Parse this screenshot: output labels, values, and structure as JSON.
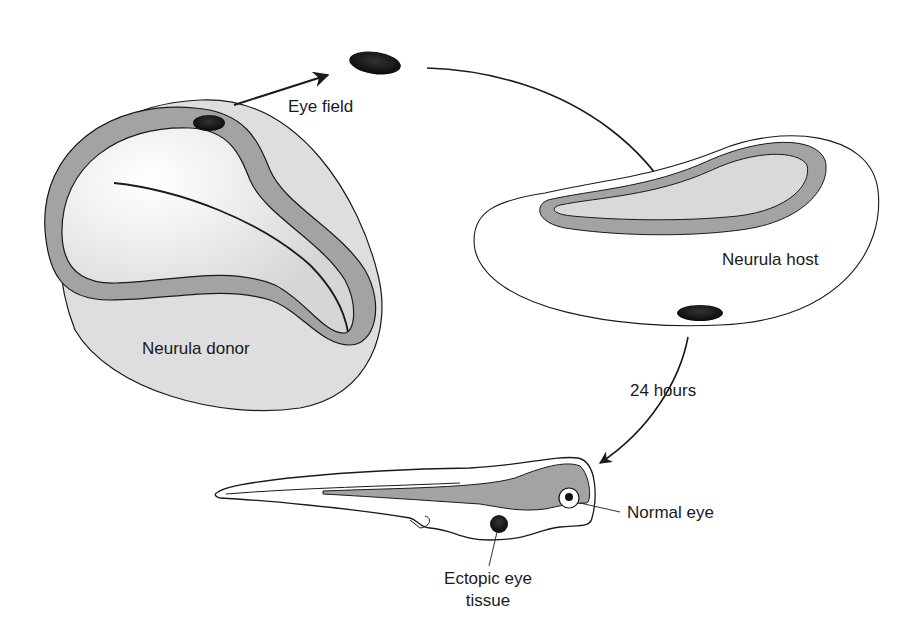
{
  "diagram": {
    "type": "experimental-procedure",
    "nodes": [
      {
        "id": "donor",
        "label": "Neurula donor"
      },
      {
        "id": "eye_field",
        "label": "Eye field"
      },
      {
        "id": "host",
        "label": "Neurula host"
      },
      {
        "id": "larva",
        "label": ""
      },
      {
        "id": "normal_eye",
        "label": "Normal eye"
      },
      {
        "id": "ectopic",
        "label": "Ectopic eye tissue"
      }
    ],
    "edges": [
      {
        "from": "donor",
        "to": "eye_field",
        "label": ""
      },
      {
        "from": "eye_field",
        "to": "host",
        "label": ""
      },
      {
        "from": "host",
        "to": "larva",
        "label": "24 hours"
      }
    ]
  },
  "labels": {
    "eye_field": "Eye field",
    "neurula_donor": "Neurula donor",
    "neurula_host": "Neurula host",
    "time": "24 hours",
    "normal_eye": "Normal eye",
    "ectopic_line1": "Ectopic eye",
    "ectopic_line2": "tissue"
  },
  "colors": {
    "outline": "#1a1a1a",
    "neural_plate": "#9e9e9e",
    "body_fill": "#dcdcdc",
    "inner_fill": "#ececec",
    "eye_tissue": "#111111"
  }
}
